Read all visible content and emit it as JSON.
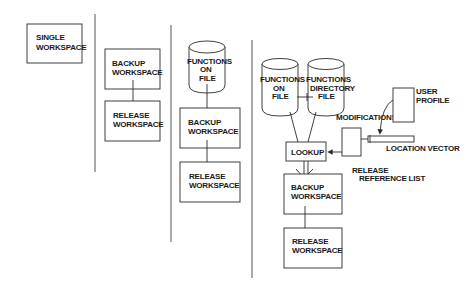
{
  "diagram": {
    "panel1": {
      "single_workspace": [
        "SINGLE",
        "WORKSPACE"
      ]
    },
    "panel2": {
      "backup_workspace": [
        "BACKUP",
        "WORKSPACE"
      ],
      "release_workspace": [
        "RELEASE",
        "WORKSPACE"
      ]
    },
    "panel3": {
      "functions_on_file": [
        "FUNCTIONS",
        "ON",
        "FILE"
      ],
      "backup_workspace": [
        "BACKUP",
        "WORKSPACE"
      ],
      "release_workspace": [
        "RELEASE",
        "WORKSPACE"
      ]
    },
    "panel4": {
      "functions_on_file": [
        "FUNCTIONS",
        "ON",
        "FILE"
      ],
      "functions_directory_file": [
        "FUNCTIONS",
        "DIRECTORY",
        "FILE"
      ],
      "lookup": "LOOKUP",
      "modifications": "MODIFICATIONS",
      "user_profile": [
        "USER",
        "PROFILE"
      ],
      "location_vector": "LOCATION VECTOR",
      "release_reference_list": [
        "RELEASE",
        "REFERENCE LIST"
      ],
      "backup_workspace": [
        "BACKUP",
        "WORKSPACE"
      ],
      "release_workspace": [
        "RELEASE",
        "WORKSPACE"
      ]
    }
  },
  "colors": {
    "ink": "#2a2a2a",
    "background": "#ffffff"
  }
}
